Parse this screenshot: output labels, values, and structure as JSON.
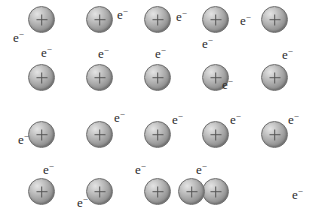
{
  "diagram": {
    "background_color": "#ffffff",
    "ion_label": "+",
    "electron_label": "e",
    "electron_charge": "−",
    "ion_symbol_name": "positive-metal-ion",
    "electron_symbol_name": "delocalised-electron",
    "ion_diameter_px": 27,
    "ion_fill_light": "#e4e4e4",
    "ion_fill_dark": "#7e7e7e",
    "ion_border_color": "#6e6e6e",
    "text_color": "#2b2b2b",
    "rows": 4,
    "columns": 5,
    "ions": [
      {
        "row": 1,
        "col": 1,
        "x": 28,
        "y": 6
      },
      {
        "row": 1,
        "col": 2,
        "x": 86,
        "y": 6
      },
      {
        "row": 1,
        "col": 3,
        "x": 144,
        "y": 6
      },
      {
        "row": 1,
        "col": 4,
        "x": 202,
        "y": 6
      },
      {
        "row": 1,
        "col": 5,
        "x": 261,
        "y": 6
      },
      {
        "row": 2,
        "col": 1,
        "x": 28,
        "y": 64
      },
      {
        "row": 2,
        "col": 2,
        "x": 86,
        "y": 64
      },
      {
        "row": 2,
        "col": 3,
        "x": 144,
        "y": 64
      },
      {
        "row": 2,
        "col": 4,
        "x": 202,
        "y": 64
      },
      {
        "row": 2,
        "col": 5,
        "x": 261,
        "y": 64
      },
      {
        "row": 3,
        "col": 1,
        "x": 28,
        "y": 121
      },
      {
        "row": 3,
        "col": 2,
        "x": 86,
        "y": 121
      },
      {
        "row": 3,
        "col": 3,
        "x": 144,
        "y": 121
      },
      {
        "row": 3,
        "col": 4,
        "x": 202,
        "y": 121
      },
      {
        "row": 3,
        "col": 5,
        "x": 261,
        "y": 121
      },
      {
        "row": 4,
        "col": 1,
        "x": 28,
        "y": 178
      },
      {
        "row": 4,
        "col": 2,
        "x": 86,
        "y": 178
      },
      {
        "row": 4,
        "col": 3,
        "x": 144,
        "y": 178
      },
      {
        "row": 4,
        "col": 4,
        "x": 202,
        "y": 178
      },
      {
        "row": 4,
        "col": 5,
        "x": 178,
        "y": 178
      }
    ],
    "electrons": [
      {
        "id": 1,
        "x": 13,
        "y": 31
      },
      {
        "id": 2,
        "x": 117,
        "y": 8
      },
      {
        "id": 3,
        "x": 176,
        "y": 10
      },
      {
        "id": 4,
        "x": 240,
        "y": 14
      },
      {
        "id": 5,
        "x": 41,
        "y": 46
      },
      {
        "id": 6,
        "x": 202,
        "y": 37
      },
      {
        "id": 7,
        "x": 98,
        "y": 47
      },
      {
        "id": 8,
        "x": 155,
        "y": 47
      },
      {
        "id": 9,
        "x": 282,
        "y": 48
      },
      {
        "id": 10,
        "x": 222,
        "y": 78
      },
      {
        "id": 11,
        "x": 18,
        "y": 133
      },
      {
        "id": 12,
        "x": 114,
        "y": 111
      },
      {
        "id": 13,
        "x": 172,
        "y": 113
      },
      {
        "id": 14,
        "x": 230,
        "y": 113
      },
      {
        "id": 15,
        "x": 288,
        "y": 113
      },
      {
        "id": 16,
        "x": 43,
        "y": 163
      },
      {
        "id": 17,
        "x": 135,
        "y": 163
      },
      {
        "id": 18,
        "x": 196,
        "y": 163
      },
      {
        "id": 19,
        "x": 77,
        "y": 196
      },
      {
        "id": 20,
        "x": 292,
        "y": 188
      }
    ]
  }
}
